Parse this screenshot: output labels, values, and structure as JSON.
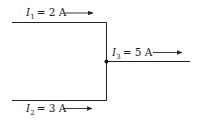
{
  "diagram": {
    "currents": [
      {
        "symbol": "I",
        "subscript": "1",
        "value": "= 2 A",
        "direction": "right"
      },
      {
        "symbol": "I",
        "subscript": "2",
        "value": "= 3 A",
        "direction": "right"
      },
      {
        "symbol": "I",
        "subscript": "3",
        "value": "= 5 A",
        "direction": "right"
      }
    ],
    "colors": {
      "line": "#222222",
      "background": "#ffffff"
    }
  }
}
